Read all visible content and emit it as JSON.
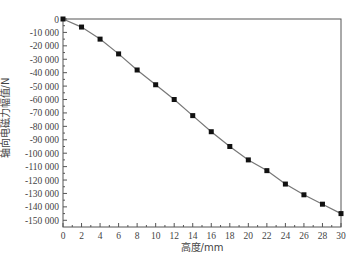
{
  "chart_data": {
    "type": "line",
    "title": "",
    "xlabel": "高度/mm",
    "ylabel": "轴向电磁力幅值/N",
    "xlim": [
      0,
      30
    ],
    "ylim": [
      -155000,
      0
    ],
    "grid": false,
    "legend": null,
    "x_ticks": [
      0,
      2,
      4,
      6,
      8,
      10,
      12,
      14,
      16,
      18,
      20,
      22,
      24,
      26,
      28,
      30
    ],
    "y_ticks": [
      0,
      -10000,
      -20000,
      -30000,
      -40000,
      -50000,
      -60000,
      -70000,
      -80000,
      -90000,
      -100000,
      -110000,
      -120000,
      -130000,
      -140000,
      -150000
    ],
    "y_tick_labels": [
      "0",
      "-10 000",
      "-20 000",
      "-30 000",
      "-40 000",
      "-50 000",
      "-60 000",
      "-70 000",
      "-80 000",
      "-90 000",
      "-100 000",
      "-110 000",
      "-120 000",
      "-130 000",
      "-140 000",
      "-150 000"
    ],
    "series": [
      {
        "name": "轴向电磁力幅值",
        "marker": "square",
        "color": "#111111",
        "line_color": "#777777",
        "x": [
          0,
          2,
          4,
          6,
          8,
          10,
          12,
          14,
          16,
          18,
          20,
          22,
          24,
          26,
          28,
          30
        ],
        "values": [
          0,
          -6000,
          -15000,
          -26000,
          -38000,
          -49000,
          -60000,
          -72000,
          -84000,
          -95000,
          -105000,
          -113000,
          -123000,
          -131000,
          -138000,
          -145000
        ]
      }
    ]
  }
}
